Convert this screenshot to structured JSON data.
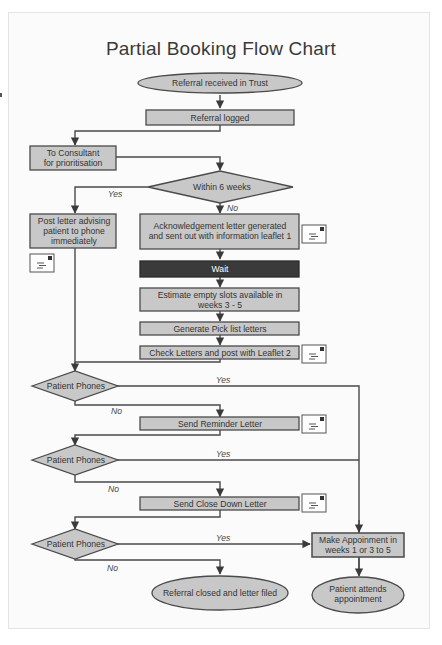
{
  "title": "Partial Booking Flow Chart",
  "colors": {
    "box_fill": "#c8c8c8",
    "box_stroke": "#4a4a4a",
    "wait_fill": "#3a3a3a",
    "line": "#4a4a4a",
    "background": "#fbfbfb"
  },
  "nodes": {
    "referral_received": {
      "type": "terminal",
      "lines": [
        "Referral received in Trust"
      ]
    },
    "referral_logged": {
      "type": "process",
      "lines": [
        "Referral logged"
      ]
    },
    "to_consultant": {
      "type": "process",
      "lines": [
        "To Consultant",
        "for prioritisation"
      ]
    },
    "within_6_weeks": {
      "type": "decision",
      "lines": [
        "Within 6 weeks"
      ]
    },
    "post_letter": {
      "type": "process",
      "lines": [
        "Post letter advising",
        "patient to phone",
        "immediately"
      ]
    },
    "ack_letter": {
      "type": "process",
      "lines": [
        "Acknowledgement letter generated",
        "and sent out with information leaflet 1"
      ]
    },
    "wait": {
      "type": "process-dark",
      "lines": [
        "Wait"
      ]
    },
    "estimate_slots": {
      "type": "process",
      "lines": [
        "Estimate empty slots available in",
        "weeks 3 - 5"
      ]
    },
    "generate_pick": {
      "type": "process",
      "lines": [
        "Generate Pick list letters"
      ]
    },
    "check_letters": {
      "type": "process",
      "lines": [
        "Check Letters and post with Leaflet 2"
      ]
    },
    "patient_phones_1": {
      "type": "decision",
      "lines": [
        "Patient Phones"
      ]
    },
    "send_reminder": {
      "type": "process",
      "lines": [
        "Send Reminder Letter"
      ]
    },
    "patient_phones_2": {
      "type": "decision",
      "lines": [
        "Patient Phones"
      ]
    },
    "send_close_down": {
      "type": "process",
      "lines": [
        "Send Close Down Letter"
      ]
    },
    "patient_phones_3": {
      "type": "decision",
      "lines": [
        "Patient Phones"
      ]
    },
    "make_appointment": {
      "type": "process",
      "lines": [
        "Make Appoinment in",
        "weeks 1 or 3 to 5"
      ]
    },
    "referral_closed": {
      "type": "terminal",
      "lines": [
        "Referral closed and letter filed"
      ]
    },
    "patient_attends": {
      "type": "terminal",
      "lines": [
        "Patient attends",
        "appointment"
      ]
    }
  },
  "edge_labels": {
    "yes_within": "Yes",
    "no_within": "No",
    "yes_phones_1": "Yes",
    "no_phones_1": "No",
    "yes_phones_2": "Yes",
    "no_phones_2": "No",
    "yes_phones_3": "Yes",
    "no_phones_3": "No"
  },
  "icons": {
    "envelope": "letter-envelope-icon"
  }
}
